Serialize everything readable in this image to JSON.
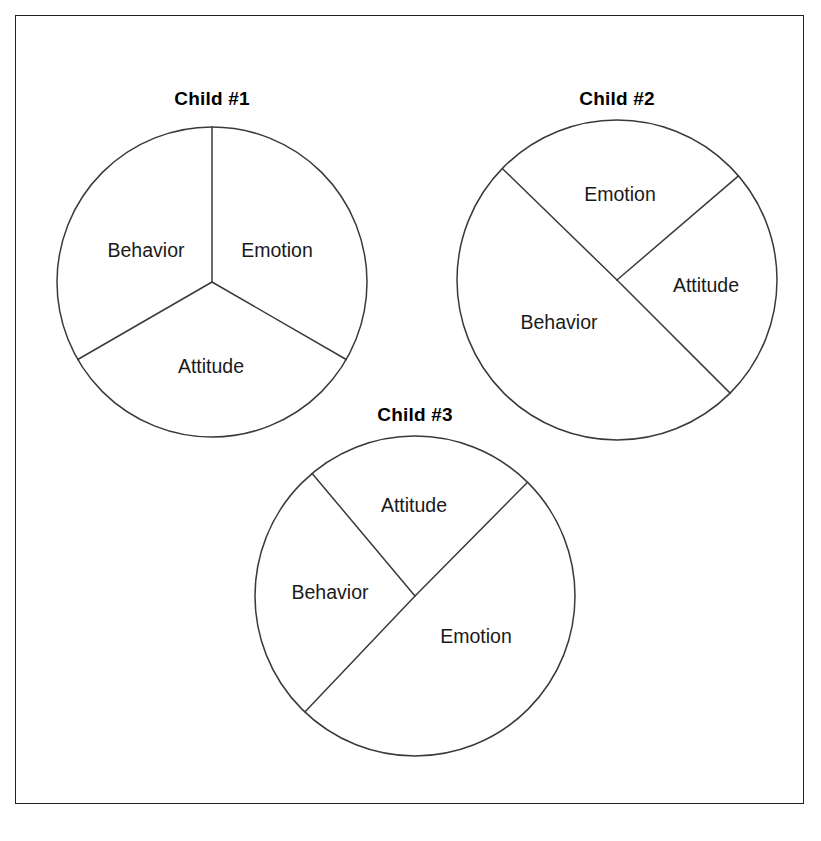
{
  "figure": {
    "background_color": "#ffffff",
    "frame_color": "#222222",
    "line_color": "#3a3a3a",
    "text_color": "#1a1a1a",
    "slice_labels": [
      "Behavior",
      "Emotion",
      "Attitude"
    ]
  },
  "charts": [
    {
      "id": "child-1",
      "title": "Child #1",
      "title_x": 212,
      "title_y": 88,
      "center_x": 212,
      "center_y": 282,
      "radius": 155,
      "start_angle": 90,
      "labels": [
        {
          "text": "Behavior",
          "x": 146,
          "y": 250
        },
        {
          "text": "Emotion",
          "x": 277,
          "y": 250
        },
        {
          "text": "Attitude",
          "x": 211,
          "y": 366
        }
      ],
      "boundaries_deg": [
        90,
        210,
        330
      ]
    },
    {
      "id": "child-2",
      "title": "Child #2",
      "title_x": 617,
      "title_y": 88,
      "center_x": 617,
      "center_y": 280,
      "radius": 160,
      "labels": [
        {
          "text": "Emotion",
          "x": 620,
          "y": 194
        },
        {
          "text": "Attitude",
          "x": 706,
          "y": 285
        },
        {
          "text": "Behavior",
          "x": 559,
          "y": 322
        }
      ],
      "boundaries_deg": [
        135.8,
        40.6,
        315.0
      ]
    },
    {
      "id": "child-3",
      "title": "Child #3",
      "title_x": 415,
      "title_y": 404,
      "center_x": 415,
      "center_y": 596,
      "radius": 160,
      "labels": [
        {
          "text": "Attitude",
          "x": 414,
          "y": 505
        },
        {
          "text": "Behavior",
          "x": 330,
          "y": 592
        },
        {
          "text": "Emotion",
          "x": 476,
          "y": 636
        }
      ],
      "boundaries_deg": [
        130.0,
        45.3,
        226.5
      ]
    }
  ],
  "chart_data": [
    {
      "type": "pie",
      "title": "Child #1",
      "categories": [
        "Emotion",
        "Behavior",
        "Attitude"
      ],
      "values": [
        33.3,
        33.3,
        33.3
      ],
      "value_unit": "percent",
      "angles_deg": [
        120,
        120,
        120
      ],
      "start_angle_deg": 90,
      "direction": "clockwise",
      "labels_inside": true,
      "legend": "none",
      "grid": false
    },
    {
      "type": "pie",
      "title": "Child #2",
      "categories": [
        "Emotion",
        "Behavior",
        "Attitude"
      ],
      "values": [
        26.4,
        49.8,
        23.8
      ],
      "value_unit": "percent",
      "angles_deg": [
        95.2,
        179.2,
        85.6
      ],
      "boundary_angles_deg": [
        40.6,
        135.8,
        315.0
      ],
      "direction": "clockwise",
      "labels_inside": true,
      "legend": "none",
      "grid": false
    },
    {
      "type": "pie",
      "title": "Child #3",
      "categories": [
        "Emotion",
        "Behavior",
        "Attitude"
      ],
      "values": [
        49.7,
        26.8,
        23.5
      ],
      "value_unit": "percent",
      "angles_deg": [
        178.8,
        96.5,
        84.7
      ],
      "boundary_angles_deg": [
        45.3,
        130.0,
        226.5
      ],
      "direction": "clockwise",
      "labels_inside": true,
      "legend": "none",
      "grid": false
    }
  ]
}
